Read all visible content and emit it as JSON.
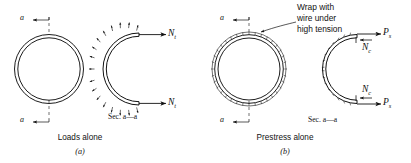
{
  "figure": {
    "type": "engineering-diagram",
    "panels": [
      {
        "id": "a",
        "letter": "(a)",
        "caption": "Loads alone",
        "section_label": "Sec. a—a",
        "section_marks": [
          "a",
          "a"
        ],
        "forces": [
          {
            "symbol": "N",
            "subscript": "t",
            "position": "top-right",
            "direction": "outward"
          },
          {
            "symbol": "N",
            "subscript": "t",
            "position": "bottom-right",
            "direction": "outward"
          }
        ],
        "pressure_arrows": {
          "count": 17,
          "direction": "radial-outward",
          "meaning": "internal pressure"
        },
        "ring_style": "plain-annulus"
      },
      {
        "id": "b",
        "letter": "(b)",
        "caption": "Prestress alone",
        "section_label": "Sec. a—a",
        "section_marks": [
          "a",
          "a"
        ],
        "annotation": {
          "line1": "Wrap with",
          "line2": "wire under",
          "line3": "high tension"
        },
        "forces": [
          {
            "symbol": "P",
            "subscript": "s",
            "position": "top-right",
            "direction": "outward"
          },
          {
            "symbol": "N",
            "subscript": "c",
            "position": "top-inner",
            "direction": "inward"
          },
          {
            "symbol": "N",
            "subscript": "c",
            "position": "bottom-inner",
            "direction": "inward"
          },
          {
            "symbol": "P",
            "subscript": "s",
            "position": "bottom-right",
            "direction": "outward"
          }
        ],
        "ring_style": "hatched-wire-wrap"
      }
    ],
    "colors": {
      "ink": "#111111",
      "background": "#ffffff"
    }
  }
}
